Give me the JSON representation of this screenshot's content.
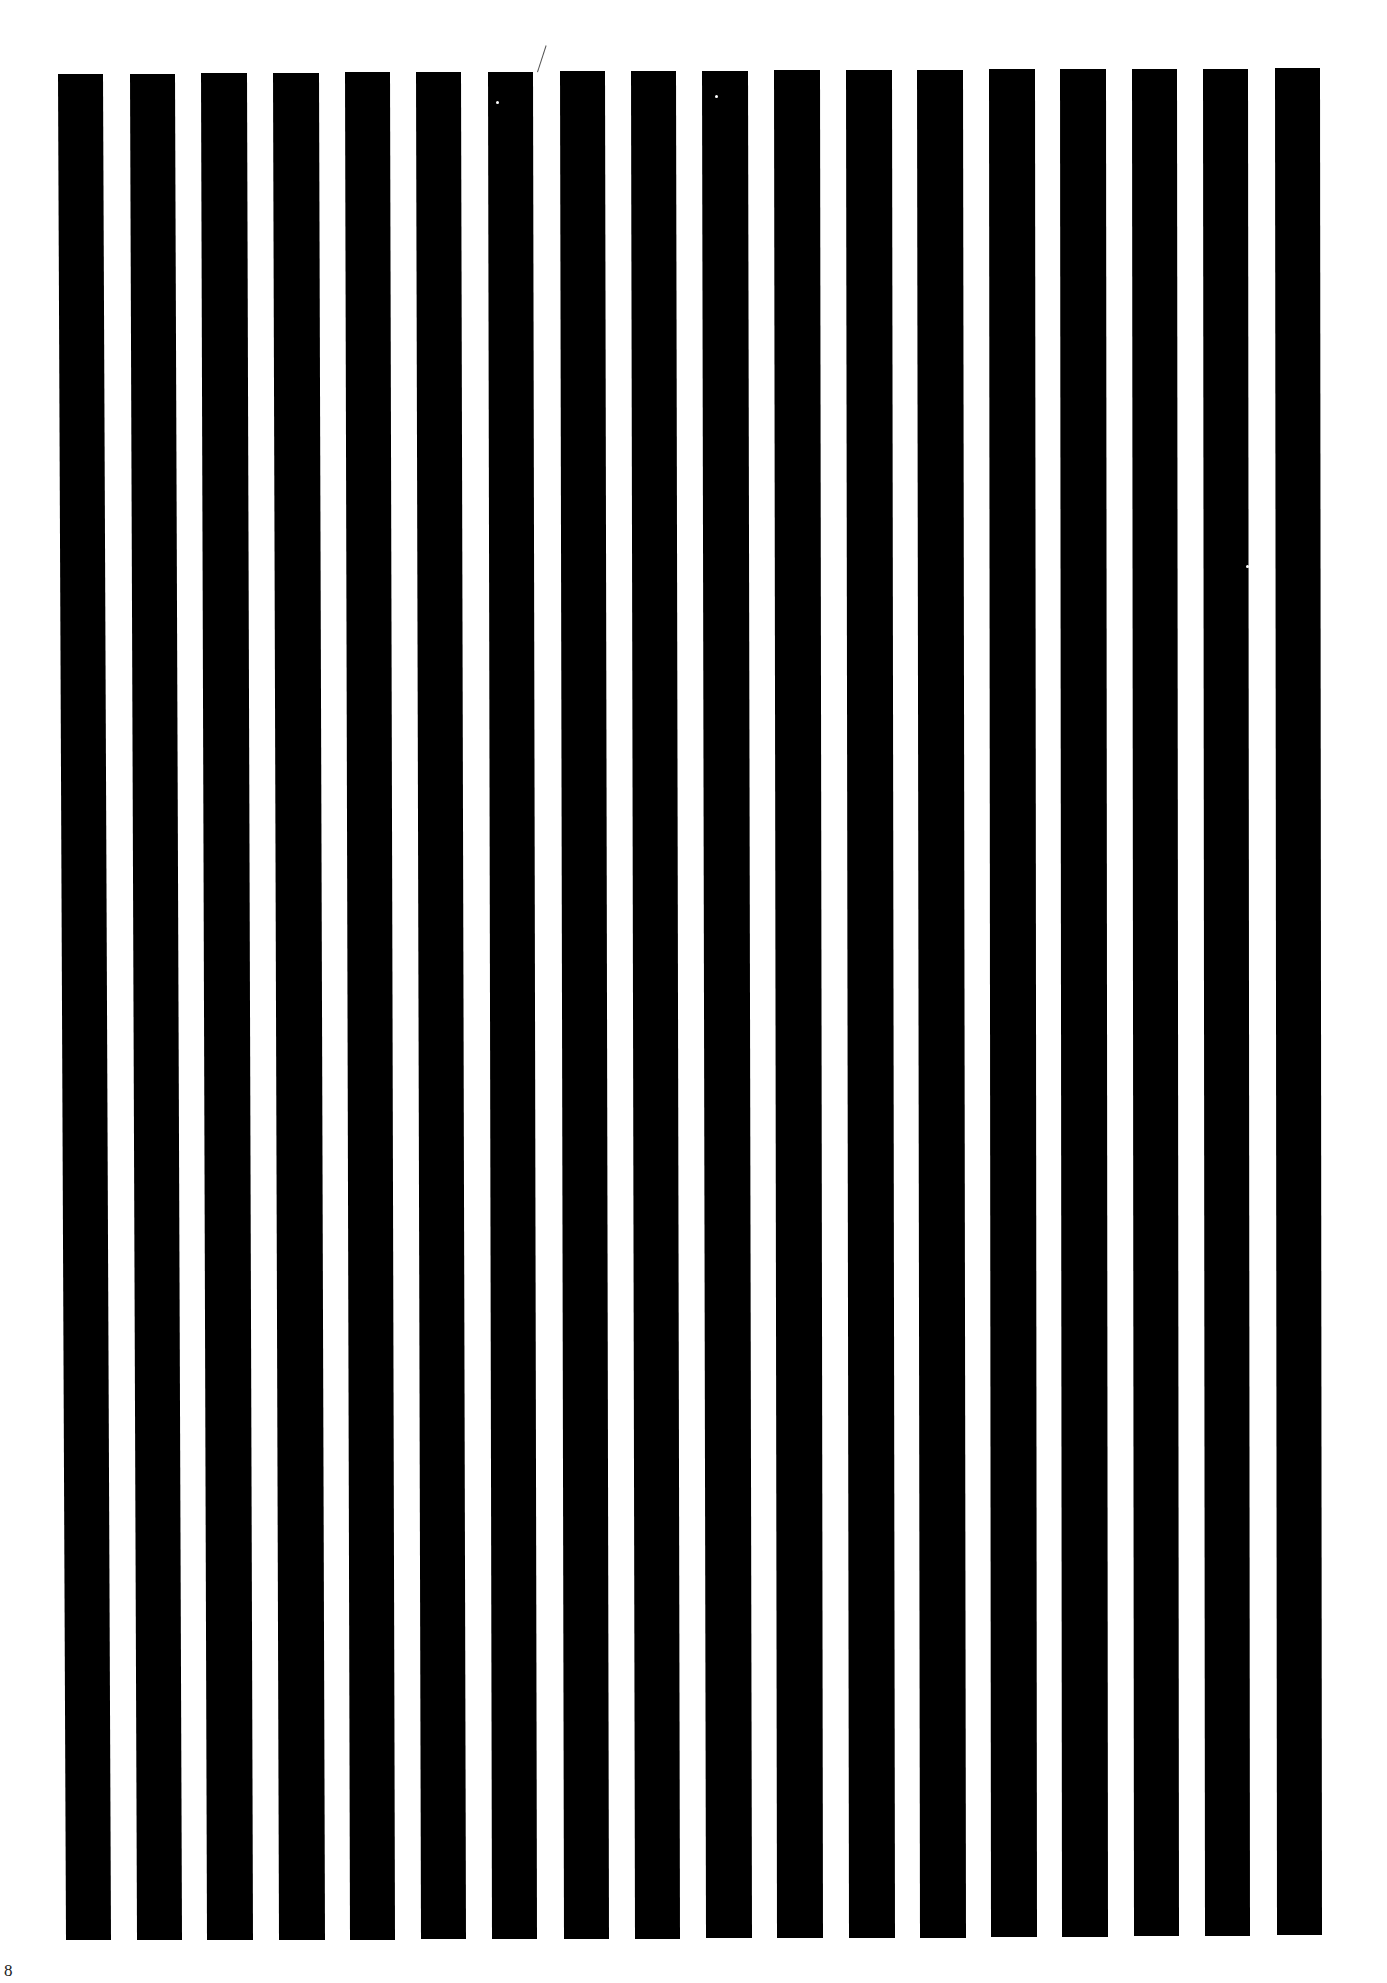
{
  "document": {
    "type": "striped test pattern page",
    "background_color": "#ffffff",
    "stripe_color": "#000000",
    "stripe_count": 18,
    "page_number": "8"
  },
  "stripes": [
    {
      "x_top": 58,
      "x_bottom": 66,
      "top": 74,
      "bottom": 1940,
      "width": 45
    },
    {
      "x_top": 130,
      "x_bottom": 137,
      "top": 74,
      "bottom": 1940,
      "width": 45
    },
    {
      "x_top": 201,
      "x_bottom": 207,
      "top": 73,
      "bottom": 1940,
      "width": 46
    },
    {
      "x_top": 273,
      "x_bottom": 279,
      "top": 73,
      "bottom": 1940,
      "width": 46
    },
    {
      "x_top": 345,
      "x_bottom": 350,
      "top": 72,
      "bottom": 1940,
      "width": 45
    },
    {
      "x_top": 416,
      "x_bottom": 421,
      "top": 72,
      "bottom": 1939,
      "width": 45
    },
    {
      "x_top": 488,
      "x_bottom": 492,
      "top": 72,
      "bottom": 1939,
      "width": 45
    },
    {
      "x_top": 560,
      "x_bottom": 564,
      "top": 71,
      "bottom": 1939,
      "width": 45
    },
    {
      "x_top": 631,
      "x_bottom": 635,
      "top": 71,
      "bottom": 1939,
      "width": 45
    },
    {
      "x_top": 702,
      "x_bottom": 706,
      "top": 71,
      "bottom": 1938,
      "width": 46
    },
    {
      "x_top": 774,
      "x_bottom": 777,
      "top": 70,
      "bottom": 1938,
      "width": 46
    },
    {
      "x_top": 846,
      "x_bottom": 849,
      "top": 70,
      "bottom": 1938,
      "width": 46
    },
    {
      "x_top": 917,
      "x_bottom": 920,
      "top": 70,
      "bottom": 1938,
      "width": 46
    },
    {
      "x_top": 989,
      "x_bottom": 991,
      "top": 69,
      "bottom": 1937,
      "width": 46
    },
    {
      "x_top": 1060,
      "x_bottom": 1062,
      "top": 69,
      "bottom": 1937,
      "width": 46
    },
    {
      "x_top": 1132,
      "x_bottom": 1134,
      "top": 69,
      "bottom": 1936,
      "width": 45
    },
    {
      "x_top": 1203,
      "x_bottom": 1205,
      "top": 69,
      "bottom": 1936,
      "width": 45
    },
    {
      "x_top": 1275,
      "x_bottom": 1277,
      "top": 68,
      "bottom": 1935,
      "width": 45
    }
  ],
  "artifacts": {
    "scratch": {
      "x": 537,
      "y": 44
    },
    "specks": [
      {
        "x": 496,
        "y": 101
      },
      {
        "x": 715,
        "y": 95
      },
      {
        "x": 1246,
        "y": 565
      },
      {
        "x": 1322,
        "y": 1128
      }
    ]
  }
}
